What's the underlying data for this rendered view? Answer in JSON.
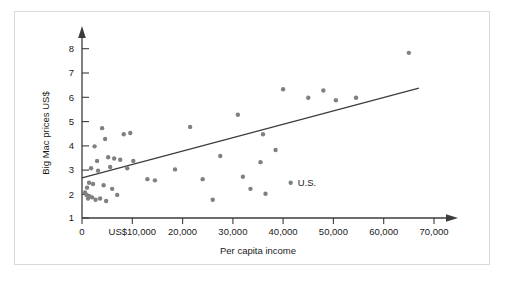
{
  "chart_data": {
    "type": "scatter",
    "title": "",
    "xlabel": "Per capita income",
    "ylabel": "Big Mac prices US$",
    "xlim": [
      0,
      72000
    ],
    "ylim": [
      1,
      8.5
    ],
    "grid": false,
    "legend": null,
    "xticks": [
      0,
      10000,
      20000,
      30000,
      40000,
      50000,
      60000,
      70000
    ],
    "xtick_labels": [
      "0",
      "US$10,000",
      "20,000",
      "30,000",
      "40,000",
      "50,000",
      "60,000",
      "70,000"
    ],
    "yticks": [
      1,
      2,
      3,
      4,
      5,
      6,
      7,
      8
    ],
    "ytick_labels": [
      "1",
      "2",
      "3",
      "4",
      "5",
      "6",
      "7",
      "8"
    ],
    "point_color": "#808080",
    "line_color": "#3c3c3c",
    "axis_color": "#3c3c3c",
    "points": [
      {
        "x": 600,
        "y": 2.05
      },
      {
        "x": 900,
        "y": 1.95
      },
      {
        "x": 1000,
        "y": 2.25
      },
      {
        "x": 1200,
        "y": 1.8
      },
      {
        "x": 1400,
        "y": 2.45
      },
      {
        "x": 1500,
        "y": 1.9
      },
      {
        "x": 1800,
        "y": 3.05
      },
      {
        "x": 2000,
        "y": 1.85
      },
      {
        "x": 2200,
        "y": 2.4
      },
      {
        "x": 2500,
        "y": 3.95
      },
      {
        "x": 2700,
        "y": 1.75
      },
      {
        "x": 3000,
        "y": 3.35
      },
      {
        "x": 3200,
        "y": 2.95
      },
      {
        "x": 3600,
        "y": 1.8
      },
      {
        "x": 4000,
        "y": 4.7
      },
      {
        "x": 4300,
        "y": 2.35
      },
      {
        "x": 4600,
        "y": 4.25
      },
      {
        "x": 4800,
        "y": 1.7
      },
      {
        "x": 5200,
        "y": 3.5
      },
      {
        "x": 5600,
        "y": 3.1
      },
      {
        "x": 6000,
        "y": 2.2
      },
      {
        "x": 6400,
        "y": 3.45
      },
      {
        "x": 7000,
        "y": 1.95
      },
      {
        "x": 7600,
        "y": 3.4
      },
      {
        "x": 8300,
        "y": 4.45
      },
      {
        "x": 9000,
        "y": 3.05
      },
      {
        "x": 9600,
        "y": 4.5
      },
      {
        "x": 10200,
        "y": 3.35
      },
      {
        "x": 13000,
        "y": 2.6
      },
      {
        "x": 14500,
        "y": 2.55
      },
      {
        "x": 18500,
        "y": 3.0
      },
      {
        "x": 21500,
        "y": 4.75
      },
      {
        "x": 24000,
        "y": 2.6
      },
      {
        "x": 26000,
        "y": 1.75
      },
      {
        "x": 27500,
        "y": 3.55
      },
      {
        "x": 31000,
        "y": 5.25
      },
      {
        "x": 32000,
        "y": 2.7
      },
      {
        "x": 33500,
        "y": 2.2
      },
      {
        "x": 35500,
        "y": 3.3
      },
      {
        "x": 36000,
        "y": 4.45
      },
      {
        "x": 36500,
        "y": 2.0
      },
      {
        "x": 38500,
        "y": 3.8
      },
      {
        "x": 40000,
        "y": 6.3
      },
      {
        "x": 41500,
        "y": 2.45
      },
      {
        "x": 45000,
        "y": 5.95
      },
      {
        "x": 48000,
        "y": 6.25
      },
      {
        "x": 50500,
        "y": 5.85
      },
      {
        "x": 54500,
        "y": 5.95
      },
      {
        "x": 65000,
        "y": 7.8
      }
    ],
    "annotations": [
      {
        "label": "U.S.",
        "x": 41500,
        "y": 2.45
      }
    ],
    "trendline": {
      "x_start": 0,
      "y_start": 2.65,
      "x_end": 67000,
      "y_end": 6.35
    }
  }
}
